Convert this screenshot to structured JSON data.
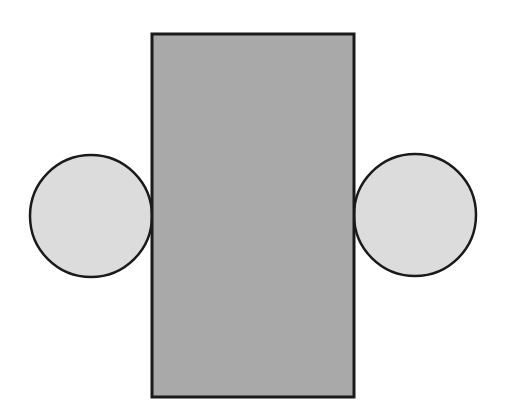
{
  "diagram": {
    "background": "#ffffff",
    "stroke_color": "#1a1a1a",
    "rectangle": {
      "x": 152,
      "y": 34,
      "width": 202,
      "height": 363,
      "fill": "#a9a9a9"
    },
    "circles": [
      {
        "name": "left-circle",
        "cx": 91,
        "cy": 216,
        "r": 61,
        "fill": "#dcdcdc"
      },
      {
        "name": "right-circle",
        "cx": 415,
        "cy": 215,
        "r": 61,
        "fill": "#dcdcdc"
      }
    ]
  }
}
